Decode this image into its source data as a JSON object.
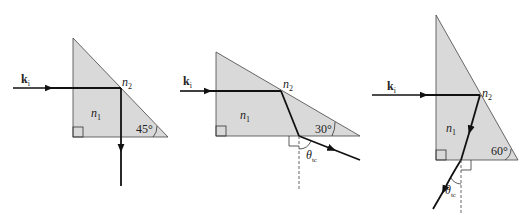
{
  "figure": {
    "colors": {
      "prism_fill": "#d9d9d9",
      "line": "#111111",
      "background": "#ffffff"
    },
    "panels": [
      {
        "id": "panel-45",
        "incident_label": "k",
        "incident_sub": "i",
        "n_outer": "n",
        "n_outer_sub": "2",
        "n_inner": "n",
        "n_inner_sub": "1",
        "angle_label": "45°"
      },
      {
        "id": "panel-30",
        "incident_label": "k",
        "incident_sub": "i",
        "n_outer": "n",
        "n_outer_sub": "2",
        "n_inner": "n",
        "n_inner_sub": "1",
        "angle_label": "30°",
        "theta_label": "θ",
        "theta_sub": "tc"
      },
      {
        "id": "panel-60",
        "incident_label": "k",
        "incident_sub": "i",
        "n_outer": "n",
        "n_outer_sub": "2",
        "n_inner": "n",
        "n_inner_sub": "1",
        "angle_label": "60°",
        "theta_label": "θ",
        "theta_sub": "tc"
      }
    ]
  }
}
